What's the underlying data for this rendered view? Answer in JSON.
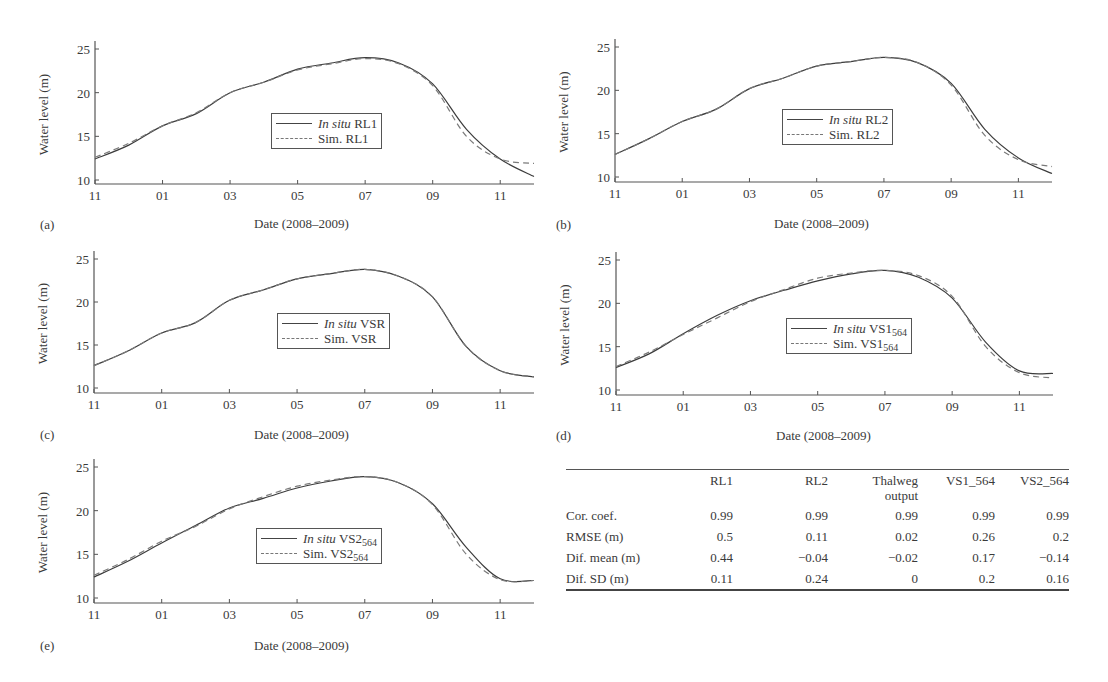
{
  "figure": {
    "x_tick_labels": [
      "11",
      "01",
      "03",
      "05",
      "07",
      "09",
      "11"
    ],
    "y_tick_labels": [
      "10",
      "15",
      "20",
      "25"
    ],
    "ylabel": "Water level (m)",
    "xlabel": "Date (2008–2009)"
  },
  "panels": [
    {
      "letter": "(a)",
      "legend_insitu_prefix": "In situ",
      "legend_insitu_name": "RL1",
      "legend_sim_prefix": "Sim.",
      "legend_sim_name": "RL1",
      "legend_sub": ""
    },
    {
      "letter": "(b)",
      "legend_insitu_prefix": "In situ",
      "legend_insitu_name": "RL2",
      "legend_sim_prefix": "Sim.",
      "legend_sim_name": "RL2",
      "legend_sub": ""
    },
    {
      "letter": "(c)",
      "legend_insitu_prefix": "In situ",
      "legend_insitu_name": "VSR",
      "legend_sim_prefix": "Sim.",
      "legend_sim_name": "VSR",
      "legend_sub": ""
    },
    {
      "letter": "(d)",
      "legend_insitu_prefix": "In situ",
      "legend_insitu_name": "VS1",
      "legend_sim_prefix": "Sim.",
      "legend_sim_name": "VS1",
      "legend_sub": "564"
    },
    {
      "letter": "(e)",
      "legend_insitu_prefix": "In situ",
      "legend_insitu_name": "VS2",
      "legend_sim_prefix": "Sim.",
      "legend_sim_name": "VS2",
      "legend_sub": "564"
    }
  ],
  "table": {
    "headers": [
      "",
      "RL1",
      "RL2",
      "Thalweg output",
      "VS1_564",
      "VS2_564"
    ],
    "header_lines": [
      [
        "",
        "RL1",
        "RL2",
        "Thalweg",
        "VS1_564",
        "VS2_564"
      ],
      [
        "",
        "",
        "",
        "output",
        "",
        ""
      ]
    ],
    "rows": [
      {
        "label": "Cor. coef.",
        "values": [
          "0.99",
          "0.99",
          "0.99",
          "0.99",
          "0.99"
        ]
      },
      {
        "label": "RMSE (m)",
        "values": [
          "0.5",
          "0.11",
          "0.02",
          "0.26",
          "0.2"
        ]
      },
      {
        "label": "Dif. mean (m)",
        "values": [
          "0.44",
          "−0.04",
          "−0.02",
          "0.17",
          "−0.14"
        ]
      },
      {
        "label": "Dif. SD (m)",
        "values": [
          "0.11",
          "0.24",
          "0",
          "0.2",
          "0.16"
        ]
      }
    ]
  },
  "colors": {
    "insitu": "#3c3c3c",
    "sim": "#7a7a7a",
    "axis": "#555555"
  },
  "chart_data": [
    {
      "type": "line",
      "panel": "(a)",
      "title": "",
      "xlabel": "Date (2008–2009)",
      "ylabel": "Water level (m)",
      "ylim": [
        10,
        25
      ],
      "grid": false,
      "legend_position": "center-right inside",
      "x": [
        "11",
        "12",
        "01",
        "02",
        "03",
        "04",
        "05",
        "06",
        "07",
        "08",
        "09",
        "10",
        "11",
        "12"
      ],
      "series": [
        {
          "name": "In situ RL1",
          "style": "solid",
          "values": [
            12.4,
            14.0,
            16.2,
            17.6,
            20.0,
            21.2,
            22.7,
            23.4,
            24.0,
            23.4,
            21.0,
            15.8,
            12.4,
            10.4
          ]
        },
        {
          "name": "Sim. RL1",
          "style": "dashed",
          "values": [
            12.6,
            14.2,
            16.2,
            17.7,
            20.0,
            21.2,
            22.6,
            23.3,
            23.9,
            23.3,
            20.8,
            15.0,
            12.4,
            11.9
          ]
        }
      ]
    },
    {
      "type": "line",
      "panel": "(b)",
      "title": "",
      "xlabel": "Date (2008–2009)",
      "ylabel": "Water level (m)",
      "ylim": [
        10,
        25
      ],
      "grid": false,
      "legend_position": "center-right inside",
      "x": [
        "11",
        "12",
        "01",
        "02",
        "03",
        "04",
        "05",
        "06",
        "07",
        "08",
        "09",
        "10",
        "11",
        "12"
      ],
      "series": [
        {
          "name": "In situ RL2",
          "style": "solid",
          "values": [
            12.6,
            14.4,
            16.4,
            17.8,
            20.2,
            21.4,
            22.8,
            23.3,
            23.8,
            23.2,
            20.8,
            15.5,
            12.2,
            10.4
          ]
        },
        {
          "name": "Sim. RL2",
          "style": "dashed",
          "values": [
            12.6,
            14.4,
            16.4,
            17.8,
            20.2,
            21.4,
            22.8,
            23.3,
            23.8,
            23.2,
            20.6,
            14.8,
            12.0,
            11.2
          ]
        }
      ]
    },
    {
      "type": "line",
      "panel": "(c)",
      "title": "",
      "xlabel": "Date (2008–2009)",
      "ylabel": "Water level (m)",
      "ylim": [
        10,
        25
      ],
      "grid": false,
      "legend_position": "center-right inside",
      "x": [
        "11",
        "12",
        "01",
        "02",
        "03",
        "04",
        "05",
        "06",
        "07",
        "08",
        "09",
        "10",
        "11",
        "12"
      ],
      "series": [
        {
          "name": "In situ VSR",
          "style": "solid",
          "values": [
            12.6,
            14.3,
            16.4,
            17.6,
            20.2,
            21.4,
            22.7,
            23.3,
            23.8,
            23.0,
            20.6,
            14.8,
            12.0,
            11.3
          ]
        },
        {
          "name": "Sim. VSR",
          "style": "dashed",
          "values": [
            12.6,
            14.3,
            16.4,
            17.6,
            20.2,
            21.4,
            22.7,
            23.3,
            23.8,
            23.0,
            20.6,
            14.8,
            12.0,
            11.3
          ]
        }
      ]
    },
    {
      "type": "line",
      "panel": "(d)",
      "title": "",
      "xlabel": "Date (2008–2009)",
      "ylabel": "Water level (m)",
      "ylim": [
        10,
        25
      ],
      "grid": false,
      "legend_position": "center-right inside",
      "x": [
        "11",
        "12",
        "01",
        "02",
        "03",
        "04",
        "05",
        "06",
        "07",
        "08",
        "09",
        "10",
        "11",
        "12"
      ],
      "series": [
        {
          "name": "In situ VS1_564",
          "style": "solid",
          "values": [
            12.6,
            14.2,
            16.5,
            18.6,
            20.3,
            21.5,
            22.6,
            23.4,
            23.8,
            23.0,
            20.6,
            15.5,
            12.2,
            11.9
          ]
        },
        {
          "name": "Sim. VS1_564",
          "style": "dashed",
          "values": [
            12.7,
            14.4,
            16.4,
            18.3,
            20.2,
            21.6,
            22.9,
            23.5,
            23.8,
            23.2,
            20.8,
            15.0,
            12.0,
            11.4
          ]
        }
      ]
    },
    {
      "type": "line",
      "panel": "(e)",
      "title": "",
      "xlabel": "Date (2008–2009)",
      "ylabel": "Water level (m)",
      "ylim": [
        10,
        25
      ],
      "grid": false,
      "legend_position": "center-right inside",
      "x": [
        "11",
        "12",
        "01",
        "02",
        "03",
        "04",
        "05",
        "06",
        "07",
        "08",
        "09",
        "10",
        "11",
        "12"
      ],
      "series": [
        {
          "name": "In situ VS2_564",
          "style": "solid",
          "values": [
            12.4,
            14.2,
            16.3,
            18.3,
            20.3,
            21.4,
            22.6,
            23.4,
            23.9,
            23.2,
            20.8,
            15.8,
            12.2,
            12.0
          ]
        },
        {
          "name": "Sim. VS2_564",
          "style": "dashed",
          "values": [
            12.6,
            14.4,
            16.5,
            18.2,
            20.2,
            21.6,
            22.8,
            23.5,
            23.9,
            23.2,
            20.7,
            15.0,
            12.1,
            12.0
          ]
        }
      ]
    },
    {
      "type": "table",
      "columns": [
        "",
        "RL1",
        "RL2",
        "Thalweg output",
        "VS1_564",
        "VS2_564"
      ],
      "rows": [
        [
          "Cor. coef.",
          0.99,
          0.99,
          0.99,
          0.99,
          0.99
        ],
        [
          "RMSE (m)",
          0.5,
          0.11,
          0.02,
          0.26,
          0.2
        ],
        [
          "Dif. mean (m)",
          0.44,
          -0.04,
          -0.02,
          0.17,
          -0.14
        ],
        [
          "Dif. SD (m)",
          0.11,
          0.24,
          0,
          0.2,
          0.16
        ]
      ]
    }
  ]
}
